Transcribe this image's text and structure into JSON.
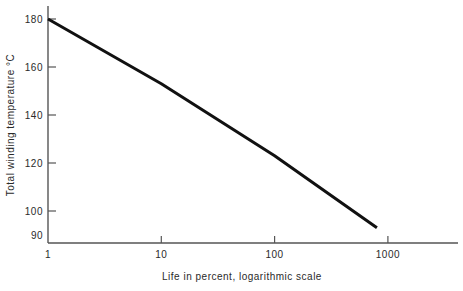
{
  "chart_data": {
    "type": "line",
    "title": "",
    "xlabel": "Life in percent, logarithmic scale",
    "ylabel": "Total winding temperature °C",
    "xscale": "log",
    "yscale": "linear",
    "xlim": [
      1,
      2000
    ],
    "ylim": [
      90,
      182
    ],
    "grid": false,
    "legend": null,
    "xticks": [
      {
        "value": 1,
        "label": "1"
      },
      {
        "value": 10,
        "label": "10"
      },
      {
        "value": 100,
        "label": "100"
      },
      {
        "value": 1000,
        "label": "1000"
      }
    ],
    "yticks": [
      {
        "value": 90,
        "label": "90"
      },
      {
        "value": 100,
        "label": "100"
      },
      {
        "value": 120,
        "label": "120"
      },
      {
        "value": 140,
        "label": "140"
      },
      {
        "value": 160,
        "label": "160"
      },
      {
        "value": 180,
        "label": "180"
      }
    ],
    "series": [
      {
        "name": "Total winding temperature vs life",
        "color": "#111111",
        "linewidth": 3,
        "points": [
          {
            "x": 1,
            "y": 180
          },
          {
            "x": 10,
            "y": 153
          },
          {
            "x": 100,
            "y": 123
          },
          {
            "x": 800,
            "y": 93
          }
        ]
      }
    ]
  },
  "axis_color": "#555555",
  "background": "#ffffff"
}
